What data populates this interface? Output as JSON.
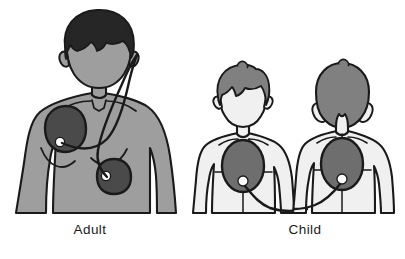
{
  "figure": {
    "background_color": "#ffffff",
    "width": 405,
    "height": 259
  },
  "palette": {
    "outline": "#1a1a1a",
    "adult_skin": "#9e9e9e",
    "adult_hair": "#262626",
    "child_skin": "#f0f0f0",
    "child_hair": "#808080",
    "pad_adult": "#4a4a4a",
    "pad_child": "#6e6e6e",
    "connector_dot": "#ffffff",
    "cable": "#1a1a1a",
    "caption_color": "#1a1a1a"
  },
  "panels": [
    {
      "id": "adult",
      "caption": "Adult",
      "figure_count": 1,
      "view": "front",
      "skin_tone": "#9e9e9e",
      "hair_tone": "#262626",
      "pads": [
        {
          "name": "upper-right-chest-pad",
          "shape": "rounded-oval",
          "position": "upper right chest below collarbone",
          "fill": "#4a4a4a",
          "connector_dot": "bottom-left"
        },
        {
          "name": "lower-left-side-pad",
          "shape": "rounded-square",
          "position": "lower left side below armpit",
          "fill": "#4a4a4a",
          "connector_dot": "center-left"
        }
      ],
      "cables": 2,
      "cable_origin": "over right shoulder from upper right"
    },
    {
      "id": "child",
      "caption": "Child",
      "figure_count": 2,
      "view": "front and back",
      "skin_tone": "#f0f0f0",
      "hair_tone": "#808080",
      "pads": [
        {
          "name": "center-chest-pad",
          "shape": "oval",
          "position": "center of chest (anterior)",
          "fill": "#6e6e6e",
          "connector_dot": "bottom-center"
        },
        {
          "name": "center-back-pad",
          "shape": "oval",
          "position": "center of back between shoulder blades (posterior)",
          "fill": "#6e6e6e",
          "connector_dot": "bottom-center"
        }
      ],
      "cables": 2,
      "cable_origin": "curving down and meeting between the two figures"
    }
  ],
  "captions": {
    "adult": "Adult",
    "child": "Child"
  }
}
